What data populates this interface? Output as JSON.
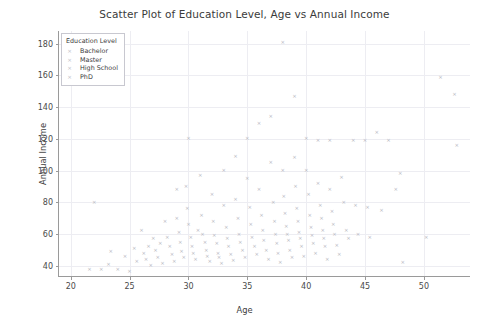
{
  "chart_data": {
    "type": "scatter",
    "title": "Scatter Plot of Education Level, Age vs Annual Income",
    "xlabel": "Age",
    "ylabel": "Annual Income",
    "xlim": [
      19.0,
      54.0
    ],
    "ylim": [
      33.0,
      188.0
    ],
    "xticks": [
      20,
      25,
      30,
      35,
      40,
      45,
      50
    ],
    "yticks": [
      40,
      60,
      80,
      100,
      120,
      140,
      160,
      180
    ],
    "grid": true,
    "marker": "x",
    "marker_color": "#b9b9c2",
    "legend": {
      "title": "Education Level",
      "position": "upper left",
      "entries": [
        {
          "label": "Bachelor",
          "marker": "x"
        },
        {
          "label": "Master",
          "marker": "x"
        },
        {
          "label": "High School",
          "marker": "x"
        },
        {
          "label": "PhD",
          "marker": "x"
        }
      ]
    },
    "points": [
      [
        21.6,
        38.0
      ],
      [
        22.0,
        80.0
      ],
      [
        22.6,
        37.5
      ],
      [
        23.2,
        41.0
      ],
      [
        23.4,
        49.0
      ],
      [
        24.0,
        38.0
      ],
      [
        24.6,
        46.0
      ],
      [
        25.0,
        36.5
      ],
      [
        25.4,
        51.0
      ],
      [
        25.6,
        43.0
      ],
      [
        26.0,
        62.5
      ],
      [
        26.2,
        48.0
      ],
      [
        26.4,
        44.0
      ],
      [
        26.6,
        52.0
      ],
      [
        26.8,
        40.0
      ],
      [
        27.0,
        57.0
      ],
      [
        27.2,
        50.0
      ],
      [
        27.4,
        45.5
      ],
      [
        27.6,
        54.0
      ],
      [
        27.8,
        41.5
      ],
      [
        28.0,
        68.0
      ],
      [
        28.2,
        58.0
      ],
      [
        28.4,
        52.5
      ],
      [
        28.6,
        47.0
      ],
      [
        28.8,
        43.0
      ],
      [
        29.0,
        88.0
      ],
      [
        29.0,
        70.0
      ],
      [
        29.2,
        61.0
      ],
      [
        29.3,
        55.0
      ],
      [
        29.4,
        49.0
      ],
      [
        29.6,
        45.0
      ],
      [
        29.8,
        90.0
      ],
      [
        29.9,
        76.0
      ],
      [
        30.0,
        120.0
      ],
      [
        30.0,
        66.0
      ],
      [
        30.2,
        58.0
      ],
      [
        30.3,
        52.0
      ],
      [
        30.4,
        47.5
      ],
      [
        30.6,
        44.0
      ],
      [
        30.8,
        62.0
      ],
      [
        31.0,
        97.0
      ],
      [
        31.1,
        72.0
      ],
      [
        31.2,
        60.0
      ],
      [
        31.4,
        55.0
      ],
      [
        31.5,
        50.0
      ],
      [
        31.6,
        46.0
      ],
      [
        31.8,
        43.0
      ],
      [
        32.0,
        85.0
      ],
      [
        32.1,
        68.0
      ],
      [
        32.2,
        59.0
      ],
      [
        32.4,
        54.0
      ],
      [
        32.5,
        48.0
      ],
      [
        32.6,
        45.0
      ],
      [
        32.8,
        41.5
      ],
      [
        33.0,
        100.0
      ],
      [
        33.0,
        78.0
      ],
      [
        33.2,
        64.0
      ],
      [
        33.3,
        57.0
      ],
      [
        33.4,
        52.0
      ],
      [
        33.6,
        47.0
      ],
      [
        33.8,
        43.5
      ],
      [
        34.0,
        109.0
      ],
      [
        34.0,
        82.0
      ],
      [
        34.2,
        70.0
      ],
      [
        34.3,
        60.0
      ],
      [
        34.4,
        55.0
      ],
      [
        34.6,
        50.0
      ],
      [
        34.8,
        45.0
      ],
      [
        35.0,
        120.0
      ],
      [
        35.0,
        95.0
      ],
      [
        35.2,
        77.0
      ],
      [
        35.3,
        66.0
      ],
      [
        35.4,
        58.0
      ],
      [
        35.6,
        52.0
      ],
      [
        35.8,
        47.0
      ],
      [
        36.0,
        130.0
      ],
      [
        36.0,
        88.0
      ],
      [
        36.2,
        72.0
      ],
      [
        36.3,
        62.0
      ],
      [
        36.4,
        56.0
      ],
      [
        36.6,
        50.0
      ],
      [
        36.8,
        44.0
      ],
      [
        37.0,
        134.0
      ],
      [
        37.0,
        105.0
      ],
      [
        37.2,
        80.0
      ],
      [
        37.3,
        68.0
      ],
      [
        37.4,
        60.0
      ],
      [
        37.5,
        54.0
      ],
      [
        37.6,
        48.0
      ],
      [
        37.8,
        42.0
      ],
      [
        38.0,
        181.0
      ],
      [
        38.0,
        100.0
      ],
      [
        38.1,
        84.0
      ],
      [
        38.2,
        73.0
      ],
      [
        38.3,
        65.0
      ],
      [
        38.4,
        60.0
      ],
      [
        38.5,
        56.0
      ],
      [
        38.6,
        50.0
      ],
      [
        38.8,
        45.0
      ],
      [
        39.0,
        147.0
      ],
      [
        39.0,
        108.0
      ],
      [
        39.1,
        90.0
      ],
      [
        39.2,
        76.0
      ],
      [
        39.3,
        68.0
      ],
      [
        39.4,
        61.0
      ],
      [
        39.5,
        57.0
      ],
      [
        39.6,
        52.0
      ],
      [
        39.8,
        46.0
      ],
      [
        40.0,
        120.0
      ],
      [
        40.0,
        100.0
      ],
      [
        40.2,
        85.0
      ],
      [
        40.3,
        72.0
      ],
      [
        40.4,
        64.0
      ],
      [
        40.5,
        59.0
      ],
      [
        40.6,
        54.0
      ],
      [
        40.8,
        48.0
      ],
      [
        41.0,
        119.0
      ],
      [
        41.0,
        92.0
      ],
      [
        41.2,
        78.0
      ],
      [
        41.3,
        70.0
      ],
      [
        41.4,
        62.0
      ],
      [
        41.5,
        57.0
      ],
      [
        41.6,
        52.0
      ],
      [
        41.8,
        44.0
      ],
      [
        42.0,
        119.0
      ],
      [
        42.0,
        88.0
      ],
      [
        42.2,
        74.0
      ],
      [
        42.3,
        66.0
      ],
      [
        42.4,
        60.0
      ],
      [
        42.6,
        53.0
      ],
      [
        42.8,
        47.0
      ],
      [
        43.0,
        96.0
      ],
      [
        43.2,
        80.0
      ],
      [
        43.4,
        62.0
      ],
      [
        43.6,
        57.0
      ],
      [
        44.0,
        119.0
      ],
      [
        44.2,
        78.0
      ],
      [
        44.4,
        60.0
      ],
      [
        45.0,
        119.0
      ],
      [
        45.2,
        77.0
      ],
      [
        45.4,
        58.0
      ],
      [
        46.0,
        124.0
      ],
      [
        46.4,
        75.0
      ],
      [
        47.0,
        119.0
      ],
      [
        47.6,
        88.0
      ],
      [
        48.0,
        98.0
      ],
      [
        48.2,
        42.0
      ],
      [
        50.2,
        58.0
      ],
      [
        51.4,
        159.0
      ],
      [
        52.6,
        148.0
      ],
      [
        52.8,
        116.0
      ]
    ]
  }
}
